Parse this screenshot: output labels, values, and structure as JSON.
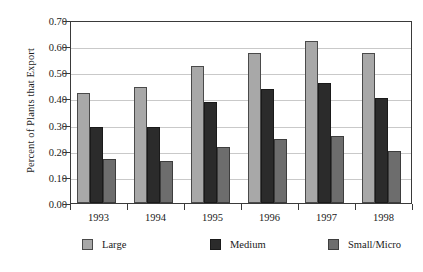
{
  "chart_data": {
    "type": "bar",
    "title": "",
    "xlabel": "",
    "ylabel": "Percent of Plants that Export",
    "categories": [
      "1993",
      "1994",
      "1995",
      "1996",
      "1997",
      "1998"
    ],
    "series": [
      {
        "name": "Large",
        "color": "#a8a8a8",
        "values": [
          0.42,
          0.445,
          0.525,
          0.575,
          0.62,
          0.575
        ]
      },
      {
        "name": "Medium",
        "color": "#2b2b2b",
        "values": [
          0.29,
          0.29,
          0.385,
          0.435,
          0.46,
          0.4
        ]
      },
      {
        "name": "Small/Micro",
        "color": "#6d6d6d",
        "values": [
          0.17,
          0.16,
          0.215,
          0.245,
          0.255,
          0.2
        ]
      }
    ],
    "ylim": [
      0.0,
      0.7
    ],
    "ytick_values": [
      0.0,
      0.1,
      0.2,
      0.3,
      0.4,
      0.5,
      0.6,
      0.7
    ],
    "ytick_labels": [
      "0.00",
      "0.10",
      "0.20",
      "0.30",
      "0.40",
      "0.50",
      "0.60",
      "0.70"
    ],
    "grid": true,
    "grid_axis": "y",
    "legend_position": "bottom",
    "legend_entries": [
      "Large",
      "Medium",
      "Small/Micro"
    ]
  }
}
